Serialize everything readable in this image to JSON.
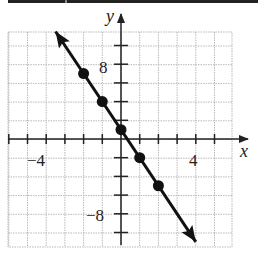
{
  "chart_data": {
    "type": "line",
    "title": "",
    "xlabel": "x",
    "ylabel": "y",
    "xlim": [
      -6,
      6
    ],
    "ylim": [
      -12,
      12
    ],
    "grid": true,
    "x_tick_labels": [
      {
        "value": -4,
        "label": "−4"
      },
      {
        "value": 4,
        "label": "4"
      }
    ],
    "y_tick_labels": [
      {
        "value": 8,
        "label": "8"
      },
      {
        "value": -8,
        "label": "−8"
      }
    ],
    "x_tick_step": 1,
    "y_tick_step": 2,
    "equation": "y = -3x + 1",
    "series": [
      {
        "name": "line",
        "points": [
          {
            "x": -2,
            "y": 7
          },
          {
            "x": -1,
            "y": 4
          },
          {
            "x": 0,
            "y": 1
          },
          {
            "x": 1,
            "y": -2
          },
          {
            "x": 2,
            "y": -5
          }
        ],
        "arrows": "both",
        "color": "#111111"
      }
    ]
  },
  "labels": {
    "x_axis": "x",
    "y_axis": "y",
    "x_neg": "−4",
    "x_pos": "4",
    "y_pos": "8",
    "y_neg": "−8"
  }
}
